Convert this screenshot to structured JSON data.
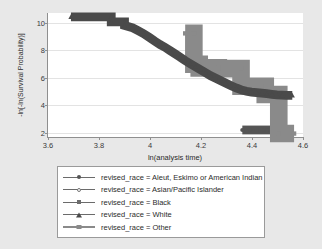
{
  "chart_data": {
    "type": "line",
    "title": "",
    "xlabel": "ln(analysis time)",
    "ylabel": "-ln[-ln(Survival Probability)]",
    "xlim": [
      3.6,
      4.6
    ],
    "ylim": [
      1.7,
      10.7
    ],
    "xticks": [
      "3.6",
      "3.8",
      "4",
      "4.2",
      "4.4",
      "4.6"
    ],
    "xtick_values": [
      3.6,
      3.8,
      4.0,
      4.2,
      4.4,
      4.6
    ],
    "yticks": [
      "2",
      "4",
      "6",
      "8",
      "10"
    ],
    "ytick_values": [
      2,
      4,
      6,
      8,
      10
    ],
    "grid": "horizontal",
    "legend_position": "below",
    "series": [
      {
        "name": "revised_race = Aleut, Eskimo or American Indian",
        "marker": "circle",
        "color": "#555555",
        "points": [
          [
            4.362,
            2.21
          ],
          [
            4.392,
            2.21
          ],
          [
            4.418,
            2.21
          ],
          [
            4.446,
            2.21
          ],
          [
            4.458,
            2.21
          ],
          [
            4.472,
            2.21
          ]
        ]
      },
      {
        "name": "revised_race = Asian/Pacific Islander",
        "marker": "open-circle",
        "color": "#777777",
        "points": []
      },
      {
        "name": "revised_race = Black",
        "marker": "square",
        "color": "#8a8a8a",
        "points": [
          [
            4.138,
            9.22
          ],
          [
            4.172,
            9.22
          ],
          [
            4.172,
            6.98
          ],
          [
            4.193,
            6.98
          ],
          [
            4.193,
            6.72
          ],
          [
            4.268,
            6.72
          ],
          [
            4.268,
            6.66
          ],
          [
            4.357,
            6.66
          ],
          [
            4.357,
            5.38
          ],
          [
            4.452,
            5.38
          ],
          [
            4.452,
            4.78
          ],
          [
            4.505,
            4.78
          ],
          [
            4.505,
            1.95
          ],
          [
            4.565,
            1.95
          ]
        ]
      },
      {
        "name": "revised_race = White",
        "marker": "triangle",
        "color": "#4a4a4a",
        "points": [
          [
            3.69,
            10.42
          ],
          [
            3.848,
            10.42
          ],
          [
            3.848,
            10.05
          ],
          [
            3.9,
            10.05
          ],
          [
            3.9,
            9.8
          ],
          [
            3.932,
            9.62
          ],
          [
            3.955,
            9.4
          ],
          [
            3.975,
            9.2
          ],
          [
            3.998,
            8.92
          ],
          [
            4.02,
            8.64
          ],
          [
            4.04,
            8.4
          ],
          [
            4.058,
            8.22
          ],
          [
            4.078,
            7.98
          ],
          [
            4.098,
            7.74
          ],
          [
            4.118,
            7.5
          ],
          [
            4.138,
            7.24
          ],
          [
            4.158,
            7.02
          ],
          [
            4.178,
            6.8
          ],
          [
            4.198,
            6.58
          ],
          [
            4.218,
            6.36
          ],
          [
            4.238,
            6.14
          ],
          [
            4.258,
            5.96
          ],
          [
            4.278,
            5.78
          ],
          [
            4.298,
            5.6
          ],
          [
            4.318,
            5.42
          ],
          [
            4.338,
            5.26
          ],
          [
            4.358,
            5.12
          ],
          [
            4.378,
            5.02
          ],
          [
            4.398,
            4.96
          ],
          [
            4.418,
            4.92
          ],
          [
            4.438,
            4.88
          ],
          [
            4.458,
            4.84
          ],
          [
            4.478,
            4.8
          ],
          [
            4.498,
            4.76
          ],
          [
            4.518,
            4.74
          ],
          [
            4.538,
            4.72
          ],
          [
            4.558,
            4.72
          ]
        ]
      },
      {
        "name": "revised_race = Other",
        "marker": "square",
        "color": "#9a9a9a",
        "points": []
      }
    ]
  },
  "legend": {
    "items": [
      {
        "label": "revised_race = Aleut, Eskimo or American Indian",
        "marker": "circle-marker"
      },
      {
        "label": "revised_race = Asian/Pacific Islander",
        "marker": "open-circle-marker"
      },
      {
        "label": "revised_race = Black",
        "marker": "square-marker"
      },
      {
        "label": "revised_race = White",
        "marker": "triangle-marker"
      },
      {
        "label": "revised_race = Other",
        "marker": "square-marker"
      }
    ]
  }
}
